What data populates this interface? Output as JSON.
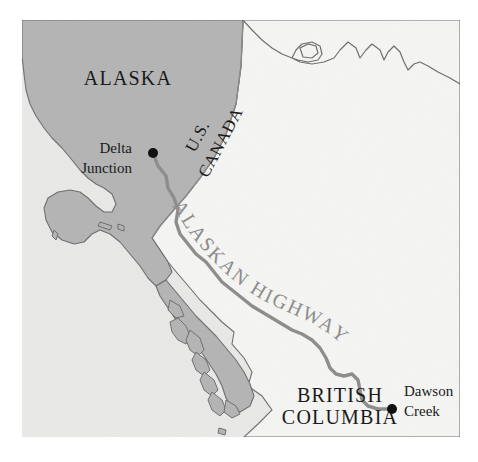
{
  "figure": {
    "kind": "reference-map",
    "canvas_width": 478,
    "canvas_height": 462,
    "map_frame": {
      "x": 22,
      "y": 20,
      "width": 438,
      "height": 417
    }
  },
  "colors": {
    "page_background": "#ffffff",
    "land_alaska": "#b4b4b4",
    "land_canada": "#f4f4f2",
    "ocean": "#e8e8e6",
    "coastline_stroke": "#6f6f6f",
    "border_stroke": "#8a8a8a",
    "highway_stroke": "#8d8d8d",
    "city_dot": "#111111",
    "label_text": "#1a1a1a",
    "highway_text": "#8d8d8d"
  },
  "labels": {
    "regions": [
      {
        "name": "alaska",
        "text": "ALASKA",
        "x": 128,
        "y": 80,
        "rotation": 0
      },
      {
        "name": "british-columbia-line1",
        "text": "BRITISH",
        "x": 340,
        "y": 397,
        "rotation": 0
      },
      {
        "name": "british-columbia-line2",
        "text": "COLUMBIA",
        "x": 340,
        "y": 419,
        "rotation": 0
      }
    ],
    "borders": [
      {
        "name": "us-side",
        "text": "U.S.",
        "x": 199,
        "y": 137,
        "rotation": -62
      },
      {
        "name": "canada-side",
        "text": "CANADA",
        "x": 222,
        "y": 143,
        "rotation": -62
      }
    ],
    "highway": {
      "name": "alaskan-highway",
      "text": "ALASKAN HIGHWAY",
      "path_id": "highway-label-path"
    },
    "cities": [
      {
        "name": "delta-junction",
        "line1": "Delta",
        "line2": "Junction",
        "text_x": 132,
        "text_y_line1": 150,
        "text_y_line2": 170,
        "dot_x": 153,
        "dot_y": 153,
        "dot_r": 5,
        "anchor": "end"
      },
      {
        "name": "dawson-creek",
        "line1": "Dawson",
        "line2": "Creek",
        "text_x": 404,
        "text_y_line1": 393,
        "text_y_line2": 413,
        "dot_x": 392,
        "dot_y": 409,
        "dot_r": 5,
        "anchor": "start"
      }
    ]
  },
  "geometry": {
    "ocean_rect": {
      "x": 22,
      "y": 20,
      "width": 438,
      "height": 417
    },
    "canada_landmass": "M 243,20 L 460,20 L 460,437 L 244,437 L 258,424 L 272,410 L 262,396 L 248,386 L 252,372 L 244,358 L 232,344 L 234,332 L 222,322 L 212,312 L 200,300 L 190,288 L 178,274 L 168,262 L 160,250 L 152,238 L 160,226 L 172,212 L 186,196 L 200,178 L 214,158 L 226,134 L 236,104 L 241,66 Z",
    "alaska_mainland": "M 22,20 L 243,20 L 241,66 L 236,104 L 226,134 L 214,158 L 200,178 L 186,196 L 172,212 L 160,226 L 152,238 L 160,250 L 168,262 L 172,272 L 166,280 L 156,286 L 148,278 L 140,266 L 130,254 L 120,242 L 110,234 L 100,230 L 92,234 L 84,242 L 74,244 L 62,240 L 52,232 L 46,220 L 44,208 L 48,198 L 58,192 L 70,190 L 80,192 L 88,198 L 96,206 L 104,212 L 112,212 L 116,204 L 112,194 L 104,188 L 96,184 L 88,178 L 80,170 L 72,160 L 62,148 L 52,138 L 44,128 L 36,116 L 30,104 L 26,90 L 24,74 L 22,56 Z",
    "alaska_panhandle": "M 166,280 L 176,292 L 186,304 L 196,316 L 206,326 L 216,336 L 226,348 L 236,360 L 244,372 L 250,384 L 254,396 L 250,406 L 240,412 L 232,408 L 226,398 L 222,386 L 216,374 L 208,362 L 200,350 L 192,340 L 184,330 L 176,320 L 168,308 L 160,296 L 156,286 Z",
    "panhandle_islands": [
      "M 178,318 L 186,326 L 190,336 L 186,344 L 178,340 L 172,332 L 170,322 Z",
      "M 190,330 L 200,338 L 204,350 L 198,356 L 190,350 L 186,340 Z",
      "M 196,352 L 206,360 L 210,370 L 204,376 L 196,370 L 192,360 Z",
      "M 204,372 L 214,380 L 218,390 L 212,396 L 204,390 L 200,380 Z",
      "M 212,392 L 222,400 L 226,410 L 220,416 L 212,410 L 208,400 Z",
      "M 170,300 L 180,306 L 184,316 L 176,318 L 168,310 Z",
      "M 226,400 L 236,406 L 240,414 L 232,418 L 224,412 Z"
    ],
    "small_islands": [
      "M 100,222 L 112,226 L 110,230 L 98,226 Z",
      "M 118,224 L 124,226 L 124,231 L 118,229 Z",
      "M 54,230 L 58,234 L 56,240 L 52,236 Z",
      "M 219,428 L 226,430 L 225,435 L 218,433 Z"
    ],
    "north_coastline": "M 243,20 L 252,30 L 262,40 L 272,48 L 282,54 L 292,58 L 296,50 L 302,44 L 312,42 L 320,46 L 322,54 L 318,60 L 308,62 L 298,60 L 292,58 L 300,62 L 312,64 L 324,62 L 334,58 L 340,50 L 348,42 L 356,48 L 360,58 L 366,50 L 372,44 L 380,50 L 384,60 L 388,52 L 394,46 L 400,52 L 404,62 L 408,70 L 414,64 L 420,62 L 428,66 L 438,72 L 450,78 L 460,84",
    "cove_outline": "M 300,48 L 308,44 L 316,46 L 318,53 L 312,58 L 303,57 Z",
    "us_canada_border": "M 243,22 L 241,66 L 236,104 L 226,134 L 214,158 L 200,178 L 186,196 L 172,212 L 160,226 L 152,238",
    "highway_path": "M 153,153 L 158,166 L 166,176 L 168,188 L 174,198 L 178,210 L 176,222 L 180,234 L 188,244 L 196,254 L 206,262 L 214,272 L 222,282 L 232,290 L 242,298 L 252,306 L 262,312 L 272,318 L 282,324 L 292,330 L 302,334 L 312,340 L 320,348 L 326,358 L 330,368 L 336,374 L 344,376 L 352,374 L 358,380 L 360,390 L 362,400 L 368,406 L 378,409 L 392,409",
    "highway_label_path": "M 168,196 L 176,212 L 186,228 L 198,244 L 212,260 L 228,276 L 246,290 L 266,302 L 288,312 L 310,322 L 330,334 L 346,348 L 356,364"
  },
  "scale_note": ""
}
